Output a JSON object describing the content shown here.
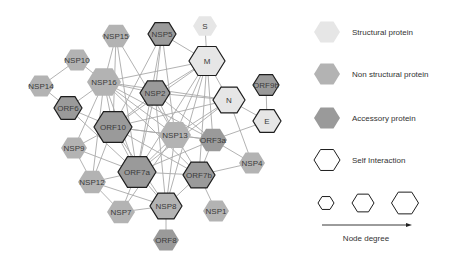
{
  "colors": {
    "structural": "#e6e6e6",
    "non_structural": "#b3b3b3",
    "accessory": "#9a9a9a",
    "self_border": "#1e1e1e",
    "edge": "#a9a9a9"
  },
  "nodes": [
    {
      "id": "S",
      "label": "S",
      "type": "structural",
      "x": 205,
      "y": 26,
      "r": 12,
      "self": false
    },
    {
      "id": "NSP15",
      "label": "NSP15",
      "type": "non_structural",
      "x": 116,
      "y": 36,
      "r": 14,
      "self": false
    },
    {
      "id": "NSP5",
      "label": "NSP5",
      "type": "accessory",
      "x": 162,
      "y": 34,
      "r": 14,
      "self": true
    },
    {
      "id": "M",
      "label": "M",
      "type": "structural",
      "x": 207,
      "y": 61,
      "r": 18,
      "self": true
    },
    {
      "id": "NSP10",
      "label": "NSP10",
      "type": "non_structural",
      "x": 77,
      "y": 60,
      "r": 13,
      "self": false
    },
    {
      "id": "NSP16",
      "label": "NSP16",
      "type": "non_structural",
      "x": 104,
      "y": 82,
      "r": 17,
      "self": false
    },
    {
      "id": "NSP14",
      "label": "NSP14",
      "type": "non_structural",
      "x": 41,
      "y": 86,
      "r": 13,
      "self": false
    },
    {
      "id": "NSP2",
      "label": "NSP2",
      "type": "accessory",
      "x": 155,
      "y": 93,
      "r": 15,
      "self": true
    },
    {
      "id": "ORF9b",
      "label": "ORF9b",
      "type": "accessory",
      "x": 266,
      "y": 85,
      "r": 13,
      "self": true
    },
    {
      "id": "N",
      "label": "N",
      "type": "structural",
      "x": 229,
      "y": 100,
      "r": 16,
      "self": true
    },
    {
      "id": "ORF6",
      "label": "ORF6",
      "type": "accessory",
      "x": 68,
      "y": 108,
      "r": 14,
      "self": true
    },
    {
      "id": "E",
      "label": "E",
      "type": "structural",
      "x": 267,
      "y": 121,
      "r": 14,
      "self": true
    },
    {
      "id": "ORF10",
      "label": "ORF10",
      "type": "accessory",
      "x": 113,
      "y": 127,
      "r": 19,
      "self": true
    },
    {
      "id": "NSP13",
      "label": "NSP13",
      "type": "non_structural",
      "x": 175,
      "y": 135,
      "r": 16,
      "self": false
    },
    {
      "id": "ORF3a",
      "label": "ORF3a",
      "type": "accessory",
      "x": 213,
      "y": 140,
      "r": 14,
      "self": false
    },
    {
      "id": "NSP9",
      "label": "NSP9",
      "type": "non_structural",
      "x": 74,
      "y": 148,
      "r": 13,
      "self": false
    },
    {
      "id": "NSP4",
      "label": "NSP4",
      "type": "non_structural",
      "x": 252,
      "y": 163,
      "r": 13,
      "self": false
    },
    {
      "id": "ORF7a",
      "label": "ORF7a",
      "type": "accessory",
      "x": 137,
      "y": 172,
      "r": 19,
      "self": true
    },
    {
      "id": "ORF7b",
      "label": "ORF7b",
      "type": "accessory",
      "x": 199,
      "y": 175,
      "r": 16,
      "self": true
    },
    {
      "id": "NSP12",
      "label": "NSP12",
      "type": "non_structural",
      "x": 92,
      "y": 182,
      "r": 14,
      "self": false
    },
    {
      "id": "NSP8",
      "label": "NSP8",
      "type": "non_structural",
      "x": 166,
      "y": 206,
      "r": 16,
      "self": true
    },
    {
      "id": "NSP7",
      "label": "NSP7",
      "type": "non_structural",
      "x": 121,
      "y": 212,
      "r": 14,
      "self": false
    },
    {
      "id": "NSP1",
      "label": "NSP1",
      "type": "non_structural",
      "x": 216,
      "y": 211,
      "r": 13,
      "self": false
    },
    {
      "id": "ORF8",
      "label": "ORF8",
      "type": "accessory",
      "x": 166,
      "y": 240,
      "r": 13,
      "self": false
    }
  ],
  "edges": [
    [
      "S",
      "M"
    ],
    [
      "NSP10",
      "NSP16"
    ],
    [
      "NSP10",
      "NSP14"
    ],
    [
      "NSP14",
      "ORF6"
    ],
    [
      "NSP15",
      "ORF10"
    ],
    [
      "NSP15",
      "ORF7a"
    ],
    [
      "NSP15",
      "NSP13"
    ],
    [
      "NSP15",
      "NSP16"
    ],
    [
      "NSP5",
      "M"
    ],
    [
      "NSP5",
      "NSP2"
    ],
    [
      "NSP5",
      "ORF10"
    ],
    [
      "NSP5",
      "NSP13"
    ],
    [
      "NSP5",
      "ORF7a"
    ],
    [
      "M",
      "NSP16"
    ],
    [
      "M",
      "NSP2"
    ],
    [
      "M",
      "ORF10"
    ],
    [
      "M",
      "NSP13"
    ],
    [
      "M",
      "ORF7a"
    ],
    [
      "M",
      "ORF7b"
    ],
    [
      "M",
      "NSP8"
    ],
    [
      "M",
      "N"
    ],
    [
      "M",
      "ORF3a"
    ],
    [
      "NSP16",
      "NSP2"
    ],
    [
      "NSP16",
      "ORF6"
    ],
    [
      "NSP16",
      "ORF10"
    ],
    [
      "NSP16",
      "NSP13"
    ],
    [
      "NSP16",
      "ORF7a"
    ],
    [
      "NSP16",
      "NSP9"
    ],
    [
      "NSP16",
      "NSP12"
    ],
    [
      "NSP16",
      "ORF3a"
    ],
    [
      "NSP16",
      "N"
    ],
    [
      "NSP16",
      "ORF7b"
    ],
    [
      "NSP2",
      "ORF10"
    ],
    [
      "NSP2",
      "NSP13"
    ],
    [
      "NSP2",
      "ORF7a"
    ],
    [
      "NSP2",
      "N"
    ],
    [
      "NSP2",
      "ORF3a"
    ],
    [
      "NSP2",
      "NSP8"
    ],
    [
      "ORF9b",
      "E"
    ],
    [
      "N",
      "E"
    ],
    [
      "N",
      "NSP4"
    ],
    [
      "N",
      "ORF10"
    ],
    [
      "N",
      "ORF7a"
    ],
    [
      "N",
      "NSP13"
    ],
    [
      "E",
      "ORF3a"
    ],
    [
      "ORF6",
      "ORF10"
    ],
    [
      "ORF6",
      "ORF7a"
    ],
    [
      "ORF10",
      "NSP13"
    ],
    [
      "ORF10",
      "ORF7a"
    ],
    [
      "ORF10",
      "NSP9"
    ],
    [
      "ORF10",
      "NSP12"
    ],
    [
      "ORF10",
      "ORF7b"
    ],
    [
      "ORF10",
      "ORF3a"
    ],
    [
      "ORF10",
      "NSP8"
    ],
    [
      "NSP13",
      "ORF3a"
    ],
    [
      "NSP13",
      "ORF7a"
    ],
    [
      "NSP13",
      "ORF7b"
    ],
    [
      "NSP13",
      "NSP8"
    ],
    [
      "NSP13",
      "NSP7"
    ],
    [
      "ORF3a",
      "NSP4"
    ],
    [
      "ORF3a",
      "ORF7a"
    ],
    [
      "ORF3a",
      "ORF7b"
    ],
    [
      "NSP9",
      "NSP12"
    ],
    [
      "NSP9",
      "ORF7a"
    ],
    [
      "NSP4",
      "ORF7b"
    ],
    [
      "ORF7a",
      "NSP12"
    ],
    [
      "ORF7a",
      "NSP8"
    ],
    [
      "ORF7a",
      "NSP7"
    ],
    [
      "ORF7a",
      "ORF7b"
    ],
    [
      "ORF7b",
      "NSP8"
    ],
    [
      "ORF7b",
      "NSP1"
    ],
    [
      "NSP12",
      "NSP8"
    ],
    [
      "NSP12",
      "NSP7"
    ],
    [
      "NSP8",
      "NSP7"
    ],
    [
      "NSP8",
      "ORF8"
    ]
  ],
  "legend": {
    "items": [
      {
        "label": "Structural protein",
        "type": "structural"
      },
      {
        "label": "Non structural protein",
        "type": "non_structural"
      },
      {
        "label": "Accessory protein",
        "type": "accessory"
      },
      {
        "label": "Self Interaction",
        "type": "self"
      }
    ],
    "degree_label": "Node degree"
  }
}
